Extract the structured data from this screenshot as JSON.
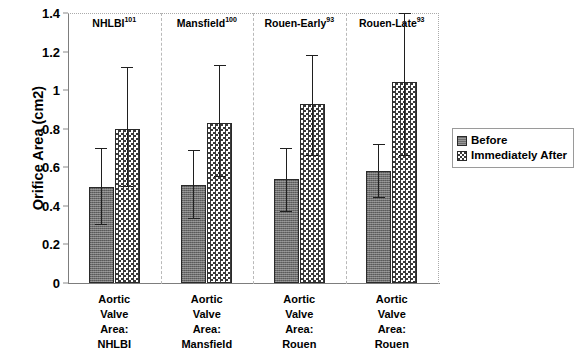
{
  "chart_data": {
    "type": "bar",
    "title": "",
    "xlabel": "",
    "ylabel": "Orifice Area (cm2)",
    "ylim": [
      0,
      1.4
    ],
    "ytick_labels": [
      "0",
      "0.2",
      "0.4",
      "0.6",
      "0.8",
      "1",
      "1.2",
      "1.4"
    ],
    "ytick_values": [
      0,
      0.2,
      0.4,
      0.6,
      0.8,
      1.0,
      1.2,
      1.4
    ],
    "grid": false,
    "legend_position": "right",
    "error_bars": "range",
    "categories": [
      "Aortic Valve Area: NHLBI",
      "Aortic Valve Area: Mansfield",
      "Aortic Valve Area: Rouen",
      "Aortic Valve Area: Rouen"
    ],
    "group_headers": [
      {
        "name": "NHLBI",
        "reference": "101"
      },
      {
        "name": "Mansfield",
        "reference": "100"
      },
      {
        "name": "Rouen-Early",
        "reference": "93"
      },
      {
        "name": "Rouen-Late",
        "reference": "93"
      }
    ],
    "xtick_label_lines": [
      [
        "Aortic",
        "Valve",
        "Area:",
        "NHLBI"
      ],
      [
        "Aortic",
        "Valve",
        "Area:",
        "Mansfield"
      ],
      [
        "Aortic",
        "Valve",
        "Area:",
        "Rouen"
      ],
      [
        "Aortic",
        "Valve",
        "Area:",
        "Rouen"
      ]
    ],
    "series": [
      {
        "name": "Before",
        "color": "#6e6e6e",
        "pattern": "solid-gray",
        "values": [
          0.5,
          0.51,
          0.54,
          0.58
        ],
        "err_low": [
          0.3,
          0.33,
          0.37,
          0.44
        ],
        "err_high": [
          0.7,
          0.69,
          0.7,
          0.72
        ]
      },
      {
        "name": "Immediately After",
        "color": "#3a3a3a",
        "pattern": "checkerboard",
        "values": [
          0.8,
          0.83,
          0.93,
          1.04
        ],
        "err_low": [
          0.5,
          0.55,
          0.66,
          0.66
        ],
        "err_high": [
          1.12,
          1.13,
          1.18,
          1.4
        ]
      }
    ]
  },
  "legend": {
    "items": [
      {
        "label": "Before"
      },
      {
        "label": "Immediately After"
      }
    ]
  },
  "axis": {
    "y_title": "Orifice Area (cm2)"
  }
}
